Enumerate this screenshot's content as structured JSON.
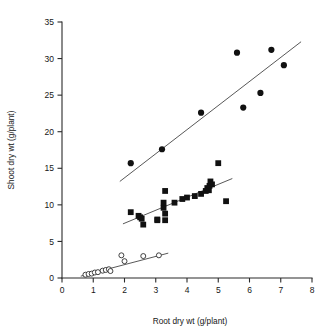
{
  "chart_data": {
    "type": "scatter",
    "title": "",
    "xlabel": "Root dry wt (g/plant)",
    "ylabel": "Shoot dry wt (g/plant)",
    "xlim": [
      0,
      8
    ],
    "ylim": [
      0,
      35
    ],
    "xticks": [
      0,
      1,
      2,
      3,
      4,
      5,
      6,
      7,
      8
    ],
    "yticks": [
      0,
      5,
      10,
      15,
      20,
      25,
      30,
      35
    ],
    "xtick_labels": [
      "0",
      "1",
      "2",
      "3",
      "4",
      "5",
      "6",
      "7",
      "8"
    ],
    "ytick_labels": [
      "0",
      "5",
      "10",
      "15",
      "20",
      "25",
      "30",
      "35"
    ],
    "grid": false,
    "legend": "none",
    "series": [
      {
        "name": "upper-series",
        "marker": "filled-circle",
        "marker_size": 3.1,
        "color": "#111111",
        "points": [
          {
            "x": 2.2,
            "y": 15.7
          },
          {
            "x": 3.2,
            "y": 17.6
          },
          {
            "x": 4.45,
            "y": 22.6
          },
          {
            "x": 5.6,
            "y": 30.8
          },
          {
            "x": 5.8,
            "y": 23.3
          },
          {
            "x": 6.35,
            "y": 25.3
          },
          {
            "x": 6.7,
            "y": 31.2
          },
          {
            "x": 7.1,
            "y": 29.1
          }
        ],
        "trend_line": {
          "x1": 1.85,
          "y1": 13.2,
          "x2": 7.65,
          "y2": 32.3
        }
      },
      {
        "name": "middle-series",
        "marker": "filled-square",
        "marker_size": 2.9,
        "color": "#111111",
        "points": [
          {
            "x": 2.2,
            "y": 9.0
          },
          {
            "x": 2.45,
            "y": 8.5
          },
          {
            "x": 2.5,
            "y": 8.3
          },
          {
            "x": 2.55,
            "y": 8.1
          },
          {
            "x": 2.6,
            "y": 7.3
          },
          {
            "x": 3.05,
            "y": 8.0
          },
          {
            "x": 3.05,
            "y": 7.9
          },
          {
            "x": 3.25,
            "y": 9.6
          },
          {
            "x": 3.25,
            "y": 10.3
          },
          {
            "x": 3.3,
            "y": 11.9
          },
          {
            "x": 3.3,
            "y": 8.8
          },
          {
            "x": 3.3,
            "y": 7.9
          },
          {
            "x": 3.6,
            "y": 10.3
          },
          {
            "x": 3.85,
            "y": 10.8
          },
          {
            "x": 4.0,
            "y": 11.0
          },
          {
            "x": 4.25,
            "y": 11.2
          },
          {
            "x": 4.45,
            "y": 11.5
          },
          {
            "x": 4.6,
            "y": 11.9
          },
          {
            "x": 4.65,
            "y": 12.3
          },
          {
            "x": 4.7,
            "y": 12.0
          },
          {
            "x": 4.72,
            "y": 12.6
          },
          {
            "x": 4.75,
            "y": 13.2
          },
          {
            "x": 4.8,
            "y": 12.8
          },
          {
            "x": 5.0,
            "y": 15.7
          },
          {
            "x": 5.25,
            "y": 10.5
          }
        ],
        "trend_line": {
          "x1": 1.95,
          "y1": 7.4,
          "x2": 5.45,
          "y2": 13.6
        }
      },
      {
        "name": "lower-series",
        "marker": "open-circle",
        "marker_size": 2.5,
        "color": "#222222",
        "points": [
          {
            "x": 0.75,
            "y": 0.45
          },
          {
            "x": 0.85,
            "y": 0.55
          },
          {
            "x": 0.95,
            "y": 0.6
          },
          {
            "x": 1.05,
            "y": 0.75
          },
          {
            "x": 1.15,
            "y": 0.8
          },
          {
            "x": 1.3,
            "y": 1.0
          },
          {
            "x": 1.4,
            "y": 1.1
          },
          {
            "x": 1.5,
            "y": 1.2
          },
          {
            "x": 1.55,
            "y": 0.95
          },
          {
            "x": 1.9,
            "y": 3.1
          },
          {
            "x": 2.0,
            "y": 2.3
          },
          {
            "x": 2.6,
            "y": 3.0
          },
          {
            "x": 3.1,
            "y": 3.1
          }
        ],
        "trend_line": {
          "x1": 0.6,
          "y1": 0.25,
          "x2": 3.4,
          "y2": 3.4
        }
      }
    ]
  },
  "axes": {
    "x_title": "Root dry wt (g/plant)",
    "y_title": "Shoot dry wt (g/plant)"
  }
}
